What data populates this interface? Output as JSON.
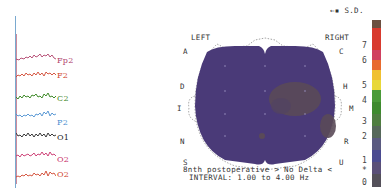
{
  "eeg": {
    "channels": [
      {
        "label": "Fp2",
        "color": "#b0406a"
      },
      {
        "label": "F2",
        "color": "#d0452e"
      },
      {
        "label": "C2",
        "color": "#3f8a2a"
      },
      {
        "label": "P2",
        "color": "#4a8fd0"
      },
      {
        "label": "O1",
        "color": "#222222"
      },
      {
        "label": "O2",
        "color": "#c8306a"
      },
      {
        "label": "O2",
        "color": "#d0452e"
      }
    ]
  },
  "map": {
    "legend_marker": "←▪ S.D.",
    "left_label": "LEFT",
    "right_label": "RIGHT",
    "left_letters": [
      "A",
      "D",
      "I",
      "N",
      "S"
    ],
    "right_letters": [
      "C",
      "H",
      "M",
      "R",
      "U"
    ],
    "caption_line1": "8nth postoperative > No Delta <",
    "caption_line2": "INTERVAL: 1.00 to 4.00 Hz",
    "fill_color": "#4a3a78",
    "hotspot_color": "#5a4a58"
  },
  "colorbar": {
    "ticks": [
      "7",
      "6",
      "5",
      "4",
      "3",
      "2",
      "1",
      "*",
      "0"
    ],
    "colors": [
      "#6b5040",
      "#d83a2e",
      "#d83a2e",
      "#d04060",
      "#e86a2e",
      "#f0c030",
      "#e8d838",
      "#4a9a38",
      "#3e8a2e",
      "#4f7e40",
      "#56685a",
      "#5a5a80",
      "#4a4a90",
      "#5a4f78",
      "#54505a"
    ]
  }
}
